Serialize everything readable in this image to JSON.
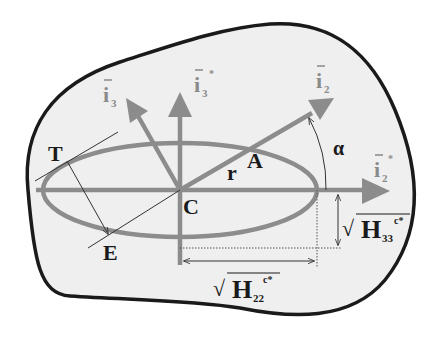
{
  "diagram": {
    "type": "ellipse-in-body",
    "colors": {
      "background": "#ffffff",
      "body_fill": "#efefef",
      "body_outline": "#1a1a1a",
      "vector_grey": "#8c8c8c",
      "thin_line": "#333333",
      "label_dark": "#1a1a1a",
      "label_grey": "#8a8a8a"
    },
    "labels": {
      "i3": {
        "base": "i",
        "sub": "3",
        "bar": true
      },
      "i3_star": {
        "base": "i",
        "sub": "3",
        "sup": "*",
        "bar": true
      },
      "i2": {
        "base": "i",
        "sub": "2",
        "bar": true
      },
      "i2_star": {
        "base": "i",
        "sub": "2",
        "sup": "*",
        "bar": true
      },
      "T": "T",
      "E": "E",
      "C": "C",
      "A": "A",
      "r": "r",
      "alpha": "α",
      "H33": {
        "radical": "√",
        "base": "H",
        "sub": "33",
        "sup": "c*"
      },
      "H22": {
        "radical": "√",
        "base": "H",
        "sub": "22",
        "sup": "c*"
      }
    },
    "nodes": [
      {
        "id": "C",
        "desc": "center of ellipse"
      },
      {
        "id": "A",
        "desc": "intersection of i2 direction with ellipse"
      },
      {
        "id": "T",
        "desc": "tangent point on ellipse"
      },
      {
        "id": "E",
        "desc": "point on ellipse, end of arrow from T"
      }
    ],
    "edges": [
      {
        "from": "C",
        "to": "i2",
        "label": "r",
        "style": "thick-grey-arrow"
      },
      {
        "from": "C",
        "to": "i3",
        "style": "thick-grey-arrow"
      },
      {
        "from": "C",
        "to": "i3*",
        "style": "thick-grey-arrow"
      },
      {
        "from": "C",
        "to": "i2*",
        "style": "thick-grey-arrow"
      },
      {
        "from": "T",
        "to": "E",
        "style": "thin-arrow"
      },
      {
        "from": "i2*",
        "to": "i2",
        "label": "α",
        "style": "arc-arrow"
      }
    ]
  }
}
